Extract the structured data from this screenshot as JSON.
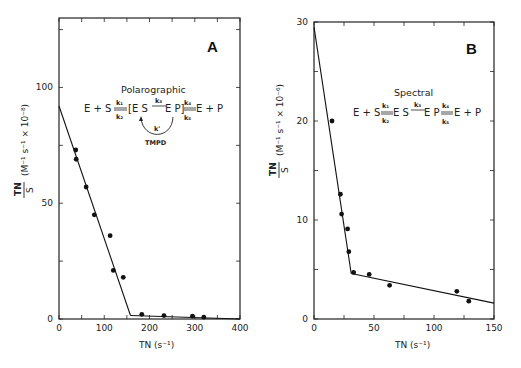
{
  "chart_data": [
    {
      "type": "scatter",
      "panel": "A",
      "title": "Polarographic",
      "scheme": {
        "left": "E + S",
        "k_forward_1": "k1",
        "k_reverse_1": "k2",
        "middle_left": "[ES",
        "k_forward_2": "k3",
        "middle_right": "EP]",
        "k_forward_3": "k4",
        "k_reverse_3": "k5",
        "right": "E + P",
        "loop_label": "k'",
        "loop_reagent": "TMPD"
      },
      "xlabel": "TN (s⁻¹)",
      "ylabel": "TN/S (M⁻¹ s⁻¹ × 10⁻⁸)",
      "xlim": [
        0,
        400
      ],
      "ylim": [
        0,
        130
      ],
      "xticks": [
        0,
        100,
        200,
        300,
        400
      ],
      "yticks": [
        0,
        50,
        100
      ],
      "grid": false,
      "points": [
        {
          "x": 37,
          "y": 73
        },
        {
          "x": 38,
          "y": 69
        },
        {
          "x": 60,
          "y": 57
        },
        {
          "x": 78,
          "y": 45
        },
        {
          "x": 113,
          "y": 36
        },
        {
          "x": 120,
          "y": 21
        },
        {
          "x": 142,
          "y": 18
        },
        {
          "x": 183,
          "y": 2
        },
        {
          "x": 232,
          "y": 1.5
        },
        {
          "x": 295,
          "y": 1.2
        },
        {
          "x": 320,
          "y": 0.8
        }
      ],
      "fit_lines": [
        {
          "from": [
            0,
            92
          ],
          "to": [
            158,
            1.5
          ]
        },
        {
          "from": [
            158,
            1.5
          ],
          "to": [
            400,
            0
          ]
        }
      ]
    },
    {
      "type": "scatter",
      "panel": "B",
      "title": "Spectral",
      "scheme": {
        "left": "E + S",
        "k_forward_1": "k1",
        "k_reverse_1": "k2",
        "middle_left": "ES",
        "k_forward_2": "k3",
        "middle_right": "EP",
        "k_forward_3": "k4",
        "k_reverse_3": "k5",
        "right": "E + P"
      },
      "xlabel": "TN (s⁻¹)",
      "ylabel": "TN/S (M⁻¹ s⁻¹ × 10⁻⁶)",
      "xlim": [
        0,
        150
      ],
      "ylim": [
        0,
        30
      ],
      "xticks": [
        0,
        50,
        100,
        150
      ],
      "yticks": [
        0,
        10,
        20,
        30
      ],
      "grid": false,
      "points": [
        {
          "x": 15,
          "y": 20
        },
        {
          "x": 22,
          "y": 12.6
        },
        {
          "x": 23,
          "y": 10.6
        },
        {
          "x": 28,
          "y": 9.1
        },
        {
          "x": 29,
          "y": 6.8
        },
        {
          "x": 33,
          "y": 4.7
        },
        {
          "x": 46,
          "y": 4.5
        },
        {
          "x": 63,
          "y": 3.4
        },
        {
          "x": 119,
          "y": 2.8
        },
        {
          "x": 129,
          "y": 1.8
        }
      ],
      "fit_lines": [
        {
          "from": [
            0,
            29.5
          ],
          "to": [
            31,
            4.6
          ]
        },
        {
          "from": [
            31,
            4.6
          ],
          "to": [
            150,
            1.6
          ]
        }
      ]
    }
  ],
  "labels": {
    "panel_a": "A",
    "panel_b": "B",
    "a_title": "Polarographic",
    "b_title": "Spectral",
    "a_xlabel": "TN (s⁻¹)",
    "b_xlabel": "TN (s⁻¹)",
    "a_ylabel_frac_top": "TN",
    "a_ylabel_frac_bottom": "S",
    "a_ylabel_units": "(M⁻¹ s⁻¹ × 10⁻⁸)",
    "b_ylabel_frac_top": "TN",
    "b_ylabel_frac_bottom": "S",
    "b_ylabel_units": "(M⁻¹ s⁻¹ × 10⁻⁶)",
    "a_xticks": [
      "0",
      "100",
      "200",
      "300",
      "400"
    ],
    "a_yticks": [
      "0",
      "50",
      "100"
    ],
    "b_xticks": [
      "0",
      "50",
      "100",
      "150"
    ],
    "b_yticks": [
      "0",
      "10",
      "20",
      "30"
    ],
    "a_scheme_left": "E + S",
    "a_scheme_k1": "k₁",
    "a_scheme_k2": "k₂",
    "a_scheme_mid_left": "[E S",
    "a_scheme_k3": "k₃",
    "a_scheme_mid_right": "E P]",
    "a_scheme_k4": "k₄",
    "a_scheme_k5": "k₅",
    "a_scheme_right": "E + P",
    "a_scheme_kprime": "k'",
    "a_scheme_tmpd": "TMPD",
    "b_scheme_left": "E + S",
    "b_scheme_k1": "k₁",
    "b_scheme_k2": "k₂",
    "b_scheme_mid_left": "E S",
    "b_scheme_k3": "k₃",
    "b_scheme_mid_right": "E P",
    "b_scheme_k4": "k₄",
    "b_scheme_k5": "k₅",
    "b_scheme_right": "E + P"
  }
}
